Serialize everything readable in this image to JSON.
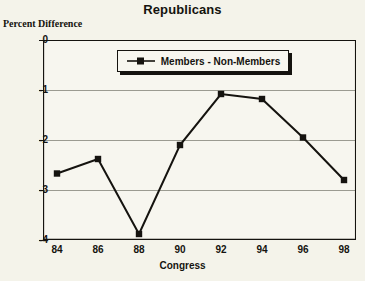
{
  "chart_data": {
    "type": "line",
    "title": "Republicans",
    "xlabel": "Congress",
    "ylabel": "Percent Difference",
    "categories": [
      "84",
      "86",
      "88",
      "90",
      "92",
      "94",
      "96",
      "98"
    ],
    "series": [
      {
        "name": "Members - Non-Members",
        "values": [
          -2.67,
          -2.38,
          -3.88,
          -2.1,
          -1.08,
          -1.18,
          -1.95,
          -2.8
        ]
      }
    ],
    "ylim": [
      -4,
      0
    ],
    "yticks": [
      "0",
      "-1",
      "-2",
      "-3",
      "-4"
    ],
    "ytick_values": [
      0,
      -1,
      -2,
      -3,
      -4
    ],
    "grid": true,
    "legend_position": "top-center",
    "marker": "square",
    "colors": {
      "line": "#15130f",
      "marker": "#15130f",
      "grid": "#9b9b91",
      "axis": "#15130f",
      "background": "#f4f3ea"
    }
  },
  "legend": {
    "label": "Members - Non-Members",
    "marker_icon": "square-marker-icon"
  }
}
